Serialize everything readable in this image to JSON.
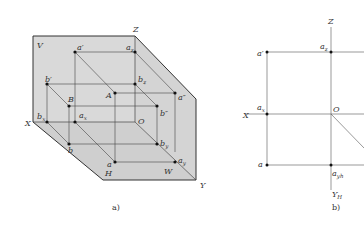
{
  "figure_a": {
    "caption": "a)",
    "planes": {
      "V": "V",
      "H": "H",
      "W": "W"
    },
    "axes": {
      "X": "X",
      "Y": "Y",
      "Z": "Z",
      "O": "O"
    },
    "points": {
      "A": "A",
      "B": "B",
      "a_prime": "a′",
      "b_prime": "b′",
      "a_dprime": "a″",
      "b_dprime": "b″",
      "a": "a",
      "b": "b",
      "a_z": "a",
      "a_z_sub": "z",
      "b_z": "b",
      "b_z_sub": "z",
      "a_x": "a",
      "a_x_sub": "x",
      "b_x": "b",
      "b_x_sub": "x",
      "a_y": "a",
      "a_y_sub": "y",
      "b_y": "b",
      "b_y_sub": "y"
    },
    "plane_color": "#d9d9d9"
  },
  "figure_b": {
    "caption": "b)",
    "axes": {
      "X": "X",
      "Z": "Z",
      "O": "O",
      "Y_H": "Y",
      "Y_H_sub": "H"
    },
    "points": {
      "a_prime": "a′",
      "a_z": "a",
      "a_z_sub": "z",
      "a_x": "a",
      "a_x_sub": "x",
      "a": "a",
      "a_yh": "a",
      "a_yh_sub": "yh"
    }
  }
}
